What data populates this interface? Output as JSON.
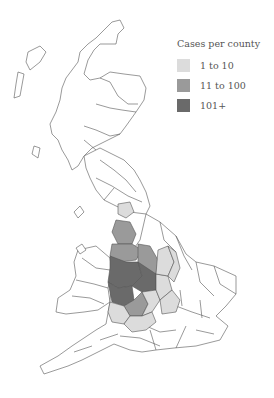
{
  "legend": {
    "title": "Cases per county",
    "items": [
      {
        "label": "1 to 10",
        "color": "#dcdcdc"
      },
      {
        "label": "11 to 100",
        "color": "#9a9a9a"
      },
      {
        "label": "101+",
        "color": "#6a6a6a"
      }
    ]
  },
  "map": {
    "region": "Great Britain",
    "outline_color": "#555555",
    "fill_none": "#ffffff"
  }
}
